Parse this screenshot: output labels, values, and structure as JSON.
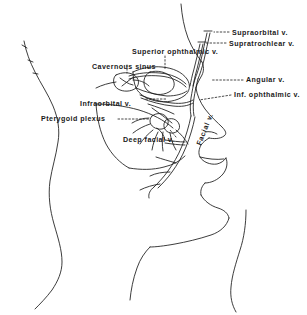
{
  "figure": {
    "kind": "anatomical-line-drawing",
    "background_color": "#ffffff",
    "line_color": "#1a1a1a",
    "leader_line_style": "dashed"
  },
  "labels": [
    {
      "id": "supraorbital",
      "text": "Supraorbital v.",
      "x": 232,
      "y": 30,
      "rotated": false
    },
    {
      "id": "supratrochlear",
      "text": "Supratrochlear v.",
      "x": 229,
      "y": 41,
      "rotated": false
    },
    {
      "id": "superior-ophthalmic",
      "text": "Superior ophthalmic v.",
      "x": 132,
      "y": 52,
      "rotated": false
    },
    {
      "id": "cavernous-sinus",
      "text": "Cavernous sinus",
      "x": 92,
      "y": 70,
      "rotated": false
    },
    {
      "id": "angular",
      "text": "Angular v.",
      "x": 246,
      "y": 83,
      "rotated": false
    },
    {
      "id": "inferior-ophthalmic",
      "text": "Inf. ophthalmic v.",
      "x": 234,
      "y": 98,
      "rotated": false
    },
    {
      "id": "infraorbital",
      "text": "Infraorbital v.",
      "x": 80,
      "y": 101,
      "rotated": false
    },
    {
      "id": "pterygoid-plexus",
      "text": "Pterygoid plexus",
      "x": 41,
      "y": 121,
      "rotated": false
    },
    {
      "id": "facial",
      "text": "Facial v.",
      "x": 196,
      "y": 144,
      "rotated": true
    },
    {
      "id": "deep-facial",
      "text": "Deep facial v.",
      "x": 123,
      "y": 140,
      "rotated": false
    }
  ]
}
